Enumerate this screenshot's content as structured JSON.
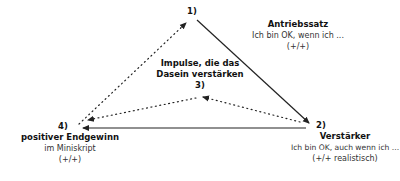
{
  "nodes": {
    "n1": {
      "number": "1)",
      "title": "Antriebssatz",
      "text": "Ich bin OK, wenn ich ...",
      "sign": "(+/+)"
    },
    "n2": {
      "number": "2)",
      "title": "Verstärker",
      "text": "Ich bin OK, auch wenn ich ...",
      "sign": "(+/+ realistisch)"
    },
    "n3": {
      "number": "3)",
      "title_line1": "Impulse, die das",
      "title_line2": "Dasein verstärken"
    },
    "n4": {
      "number": "4)",
      "title": "positiver Endgewinn",
      "text": "im Miniskript",
      "sign": "(+/+)"
    }
  },
  "edges": [
    {
      "from": "1",
      "to": "2",
      "style": "solid"
    },
    {
      "from": "2",
      "to": "4",
      "style": "solid"
    },
    {
      "from": "4",
      "to": "1",
      "style": "dotted"
    },
    {
      "from": "2",
      "to": "3",
      "style": "dotted"
    },
    {
      "from": "3",
      "to": "4",
      "style": "dotted"
    }
  ],
  "colors": {
    "line": "#222222",
    "text": "#111111"
  }
}
